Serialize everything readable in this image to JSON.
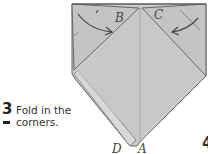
{
  "step": {
    "number": "3",
    "instruction_line1": "Fold in the",
    "instruction_line2": "corners."
  },
  "next_step": {
    "number": "4"
  },
  "diagram": {
    "labels": {
      "B": "B",
      "C": "C",
      "D": "D",
      "A": "A"
    },
    "colors": {
      "paper": "#c9c9c9",
      "paper_light": "#d8d8d8",
      "paper_dark": "#b8b8b8",
      "outline": "#555555",
      "background": "#ffffff"
    },
    "arrows": [
      "fold-arrow-left-corner",
      "fold-arrow-right-corner"
    ]
  }
}
